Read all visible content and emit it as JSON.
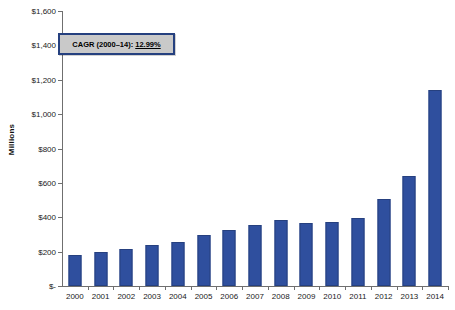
{
  "chart_data": {
    "type": "bar",
    "title": "",
    "xlabel": "",
    "ylabel": "Millions",
    "categories": [
      "2000",
      "2001",
      "2002",
      "2003",
      "2004",
      "2005",
      "2006",
      "2007",
      "2008",
      "2009",
      "2010",
      "2011",
      "2012",
      "2013",
      "2014"
    ],
    "values": [
      180,
      200,
      213,
      238,
      256,
      298,
      325,
      355,
      383,
      368,
      372,
      397,
      509,
      639,
      1140
    ],
    "ylim": [
      0,
      1600
    ],
    "ytick_values": [
      1600,
      1400,
      1200,
      1000,
      800,
      600,
      400,
      200,
      0
    ],
    "ytick_labels": [
      "$1,600",
      "$1,400",
      "$1,200",
      "$1,000",
      "$800",
      "$600",
      "$400",
      "$200",
      "$-"
    ],
    "grid": false,
    "legend": null,
    "series_color": "#2f4f9e",
    "annotations": [
      {
        "name": "cagr-callout",
        "prefix": "CAGR (2000–14): ",
        "value": "12.99%"
      }
    ]
  },
  "axis": {
    "y_title": "Millions"
  },
  "callout": {
    "prefix": "CAGR (2000–14): ",
    "value": "12.99%"
  },
  "colors": {
    "bar": "#2f4f9e",
    "bar_border": "#26407f",
    "callout_fill": "#c9c9c9",
    "callout_border": "#25407f",
    "axis": "#6f6f6f",
    "text": "#1a1a1a"
  }
}
